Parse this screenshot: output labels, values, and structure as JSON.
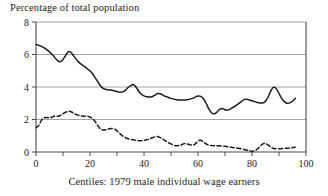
{
  "chart_data": {
    "type": "line",
    "title": "Percentage of total population",
    "xlabel": "Centiles: 1979 male individual wage earners",
    "ylabel": "Percentage of total population",
    "xlim": [
      0,
      100
    ],
    "ylim": [
      0,
      8
    ],
    "xticks": [
      0,
      10,
      20,
      30,
      40,
      50,
      60,
      70,
      80,
      90,
      100
    ],
    "xtick_labels": [
      "0",
      "",
      "20",
      "",
      "40",
      "",
      "60",
      "",
      "80",
      "",
      "100"
    ],
    "yticks": [
      0,
      2,
      4,
      6,
      8
    ],
    "ytick_labels": [
      "0",
      "2",
      "4",
      "6",
      "8"
    ],
    "grid": "horizontal",
    "legend": "none",
    "line_color": "#1a1a1a",
    "grid_color": "#9a9a9a",
    "axis_color": "#4a4a4a",
    "series": [
      {
        "name": "solid-series",
        "style": "solid",
        "x": [
          0,
          2,
          4,
          6,
          8,
          9,
          10,
          11,
          12,
          13,
          14,
          16,
          18,
          20,
          21,
          22,
          23,
          24,
          25,
          26,
          28,
          30,
          31,
          32,
          33,
          34,
          35,
          36,
          37,
          38,
          39,
          40,
          41,
          42,
          43,
          44,
          45,
          46,
          47,
          48,
          50,
          52,
          54,
          56,
          58,
          59,
          60,
          61,
          62,
          63,
          64,
          65,
          66,
          67,
          68,
          69,
          70,
          71,
          72,
          74,
          76,
          77,
          78,
          80,
          82,
          84,
          85,
          86,
          87,
          88,
          89,
          90,
          91,
          92,
          93,
          94,
          95,
          96
        ],
        "y": [
          6.62,
          6.5,
          6.3,
          6.0,
          5.62,
          5.55,
          5.7,
          5.95,
          6.18,
          6.12,
          5.9,
          5.5,
          5.25,
          5.0,
          4.8,
          4.55,
          4.3,
          4.05,
          3.9,
          3.85,
          3.8,
          3.72,
          3.68,
          3.7,
          3.78,
          3.95,
          4.08,
          4.15,
          4.0,
          3.75,
          3.55,
          3.45,
          3.4,
          3.38,
          3.4,
          3.5,
          3.6,
          3.58,
          3.5,
          3.42,
          3.3,
          3.22,
          3.2,
          3.22,
          3.3,
          3.38,
          3.45,
          3.42,
          3.28,
          3.0,
          2.65,
          2.42,
          2.35,
          2.45,
          2.62,
          2.68,
          2.6,
          2.58,
          2.65,
          2.85,
          3.1,
          3.22,
          3.25,
          3.15,
          3.05,
          3.02,
          3.12,
          3.4,
          3.78,
          3.98,
          3.9,
          3.6,
          3.3,
          3.1,
          3.0,
          3.02,
          3.12,
          3.3
        ]
      },
      {
        "name": "dashed-series",
        "style": "dashed",
        "x": [
          0,
          1,
          2,
          3,
          4,
          5,
          6,
          7,
          8,
          9,
          10,
          11,
          12,
          13,
          14,
          15,
          16,
          17,
          18,
          19,
          20,
          21,
          22,
          23,
          24,
          25,
          26,
          27,
          28,
          29,
          30,
          31,
          32,
          33,
          34,
          35,
          36,
          37,
          38,
          39,
          40,
          41,
          42,
          43,
          44,
          45,
          46,
          47,
          48,
          49,
          50,
          51,
          52,
          53,
          54,
          55,
          56,
          57,
          58,
          59,
          60,
          61,
          62,
          63,
          64,
          65,
          66,
          68,
          70,
          72,
          74,
          76,
          78,
          79,
          80,
          81,
          82,
          83,
          84,
          85,
          86,
          87,
          88,
          90,
          92,
          94,
          96
        ],
        "y": [
          1.5,
          1.62,
          1.95,
          2.1,
          2.12,
          2.1,
          2.15,
          2.22,
          2.2,
          2.25,
          2.35,
          2.45,
          2.5,
          2.48,
          2.38,
          2.3,
          2.25,
          2.22,
          2.2,
          2.2,
          2.15,
          2.05,
          1.85,
          1.6,
          1.4,
          1.35,
          1.38,
          1.42,
          1.45,
          1.42,
          1.3,
          1.15,
          1.0,
          0.9,
          0.82,
          0.78,
          0.75,
          0.72,
          0.7,
          0.7,
          0.72,
          0.75,
          0.8,
          0.88,
          0.92,
          0.95,
          0.88,
          0.78,
          0.68,
          0.58,
          0.5,
          0.42,
          0.38,
          0.4,
          0.45,
          0.52,
          0.5,
          0.45,
          0.42,
          0.5,
          0.68,
          0.72,
          0.62,
          0.5,
          0.42,
          0.4,
          0.38,
          0.38,
          0.35,
          0.3,
          0.25,
          0.2,
          0.12,
          0.08,
          0.05,
          0.08,
          0.18,
          0.35,
          0.5,
          0.52,
          0.42,
          0.3,
          0.22,
          0.2,
          0.22,
          0.25,
          0.3
        ]
      }
    ]
  }
}
